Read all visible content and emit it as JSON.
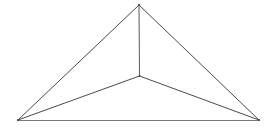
{
  "figure": {
    "background_color": "#ffffff",
    "canvas": {
      "width": 272,
      "height": 129
    },
    "line_color": "#4a4a4a",
    "line_color_light": "#6e6e6e",
    "line_width": 1,
    "vertices": [
      {
        "id": "apex",
        "label": "apex",
        "x": 139,
        "y": 5
      },
      {
        "id": "bottom-left",
        "label": "bottom-left corner",
        "x": 18,
        "y": 120
      },
      {
        "id": "bottom-right",
        "label": "bottom-right corner",
        "x": 259,
        "y": 120
      },
      {
        "id": "interior",
        "label": "interior point",
        "x": 139.5,
        "y": 76
      }
    ],
    "edges": [
      {
        "id": "edge-apex-bottom-left",
        "label": "apex to bottom-left",
        "from": "apex",
        "to": "bottom-left",
        "x1": 139,
        "y1": 5,
        "x2": 18,
        "y2": 120,
        "color": "#4a4a4a"
      },
      {
        "id": "edge-apex-bottom-right",
        "label": "apex to bottom-right",
        "from": "apex",
        "to": "bottom-right",
        "x1": 139,
        "y1": 5,
        "x2": 259,
        "y2": 120,
        "color": "#4a4a4a"
      },
      {
        "id": "edge-base",
        "label": "base, bottom-left to bottom-right",
        "from": "bottom-left",
        "to": "bottom-right",
        "x1": 18,
        "y1": 120.5,
        "x2": 259,
        "y2": 120.5,
        "color": "#7a7a7a"
      },
      {
        "id": "edge-apex-interior",
        "label": "apex to interior point",
        "from": "apex",
        "to": "interior",
        "x1": 139,
        "y1": 5,
        "x2": 139.5,
        "y2": 76,
        "color": "#5a5a5a"
      },
      {
        "id": "edge-interior-bottom-left",
        "label": "interior point to bottom-left",
        "from": "interior",
        "to": "bottom-left",
        "x1": 139.5,
        "y1": 76,
        "x2": 18,
        "y2": 120,
        "color": "#4a4a4a"
      },
      {
        "id": "edge-interior-bottom-right",
        "label": "interior point to bottom-right",
        "from": "interior",
        "to": "bottom-right",
        "x1": 139.5,
        "y1": 76,
        "x2": 259,
        "y2": 120,
        "color": "#4a4a4a"
      }
    ]
  }
}
